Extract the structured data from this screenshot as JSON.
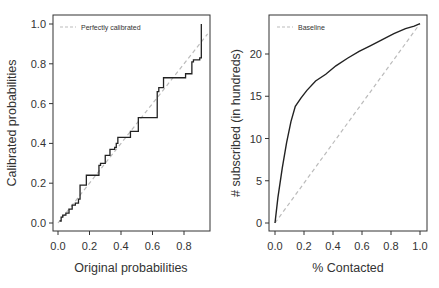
{
  "chart_data": [
    {
      "type": "line",
      "title": "",
      "xlabel": "Original probabilities",
      "ylabel": "Calibrated probabilities",
      "xlim": [
        0.0,
        0.95
      ],
      "ylim": [
        0.0,
        1.0
      ],
      "x_ticks": [
        "0.0",
        "0.2",
        "0.4",
        "0.6",
        "0.8"
      ],
      "y_ticks": [
        "0.0",
        "0.2",
        "0.4",
        "0.6",
        "0.8",
        "1.0"
      ],
      "grid": false,
      "legend": {
        "position": "top-left",
        "entries": [
          "Perfectly calibrated"
        ]
      },
      "series": [
        {
          "name": "Calibration curve",
          "style": "step",
          "color": "#222222",
          "x": [
            0.01,
            0.02,
            0.03,
            0.05,
            0.07,
            0.09,
            0.11,
            0.13,
            0.14,
            0.18,
            0.26,
            0.27,
            0.3,
            0.33,
            0.36,
            0.37,
            0.38,
            0.46,
            0.51,
            0.63,
            0.64,
            0.67,
            0.81,
            0.85,
            0.86,
            0.9,
            0.91
          ],
          "y": [
            0.01,
            0.03,
            0.04,
            0.05,
            0.07,
            0.09,
            0.1,
            0.12,
            0.19,
            0.24,
            0.29,
            0.3,
            0.34,
            0.37,
            0.38,
            0.4,
            0.43,
            0.46,
            0.53,
            0.66,
            0.68,
            0.73,
            0.75,
            0.81,
            0.82,
            0.83,
            1.0
          ]
        },
        {
          "name": "Perfectly calibrated",
          "style": "dashed",
          "color": "#bbbbbb",
          "x": [
            0.0,
            0.95
          ],
          "y": [
            0.0,
            0.95
          ]
        }
      ]
    },
    {
      "type": "line",
      "title": "",
      "xlabel": "% Contacted",
      "ylabel": "# subscribed (in hundreds)",
      "xlim": [
        0.0,
        1.0
      ],
      "ylim": [
        0,
        23.5
      ],
      "x_ticks": [
        "0.0",
        "0.2",
        "0.4",
        "0.6",
        "0.8",
        "1.0"
      ],
      "y_ticks": [
        "0",
        "5",
        "10",
        "15",
        "20"
      ],
      "grid": false,
      "legend": {
        "position": "top-left",
        "entries": [
          "Baseline"
        ]
      },
      "series": [
        {
          "name": "Gains curve",
          "style": "solid",
          "color": "#222222",
          "x": [
            0.0,
            0.02,
            0.05,
            0.08,
            0.11,
            0.14,
            0.18,
            0.22,
            0.28,
            0.35,
            0.42,
            0.5,
            0.58,
            0.66,
            0.74,
            0.82,
            0.9,
            0.96,
            1.0
          ],
          "y": [
            0,
            3,
            6.5,
            9.5,
            12,
            13.8,
            14.8,
            15.7,
            16.8,
            17.6,
            18.6,
            19.5,
            20.3,
            21.0,
            21.7,
            22.4,
            23.0,
            23.3,
            23.6
          ]
        },
        {
          "name": "Baseline",
          "style": "dashed",
          "color": "#bbbbbb",
          "x": [
            0.0,
            1.0
          ],
          "y": [
            0,
            23.6
          ]
        }
      ]
    }
  ]
}
